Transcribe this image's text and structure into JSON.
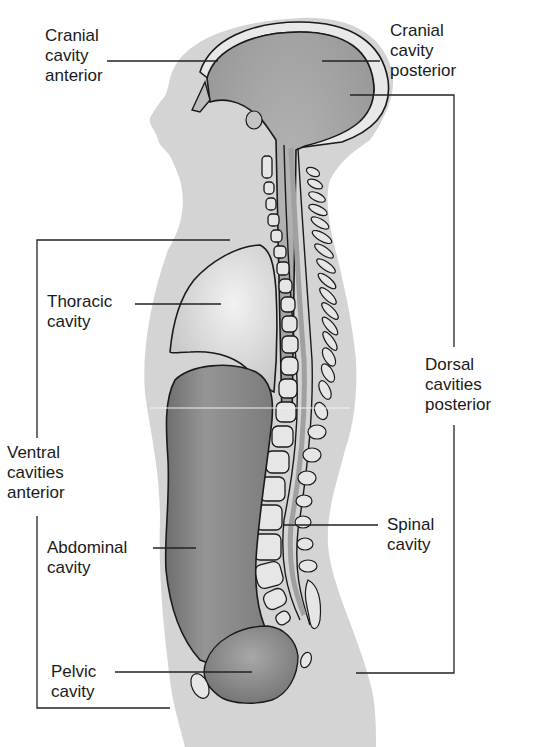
{
  "diagram": {
    "colors": {
      "body_silhouette": "#d4d4d4",
      "cranial_cavity": "#a9a9a9",
      "thoracic_cavity": "#d9d9d9",
      "abdominal_cavity": "#8c8c8c",
      "pelvic_cavity": "#9a9a9a",
      "outline": "#1a1a1a",
      "vertebra_fill": "#e6e6e6",
      "bracket_line": "#333333"
    },
    "labels": {
      "cranial_anterior": {
        "line1": "Cranial",
        "line2": "cavity",
        "line3": "anterior"
      },
      "cranial_posterior": {
        "line1": "Cranial",
        "line2": "cavity",
        "line3": "posterior"
      },
      "thoracic": {
        "line1": "Thoracic",
        "line2": "cavity"
      },
      "dorsal": {
        "line1": "Dorsal",
        "line2": "cavities",
        "line3": "posterior"
      },
      "ventral": {
        "line1": "Ventral",
        "line2": "cavities",
        "line3": "anterior"
      },
      "spinal": {
        "line1": "Spinal",
        "line2": "cavity"
      },
      "abdominal": {
        "line1": "Abdominal",
        "line2": "cavity"
      },
      "pelvic": {
        "line1": "Pelvic",
        "line2": "cavity"
      }
    }
  }
}
